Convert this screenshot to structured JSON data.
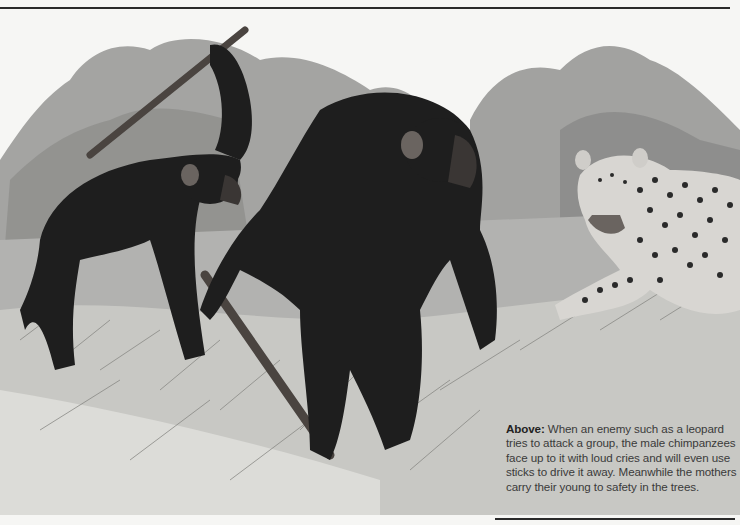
{
  "caption": {
    "lead": "Above:",
    "text": " When an enemy such as a leopard tries to attack a group, the male chimpanzees face up to it with loud cries and will even use sticks to drive it away. Meanwhile the mothers carry their young to safety in the trees."
  },
  "illustration": {
    "subject": "Two chimpanzees with sticks confronting a leopard in tall grass",
    "elements": [
      "chimpanzee-raising-stick",
      "chimpanzee-holding-stick",
      "leopard",
      "trees",
      "grass"
    ],
    "palette": {
      "background": "#f6f6f4",
      "foliage": "#9a9a98",
      "foliage_dark": "#7a7a78",
      "fur": "#1e1e1e",
      "stick": "#4a4440",
      "leopard_body": "#d8d6d2",
      "leopard_spots": "#2a2a2a",
      "grass": "#b8b8b4",
      "rule": "#2a2a2a"
    }
  }
}
